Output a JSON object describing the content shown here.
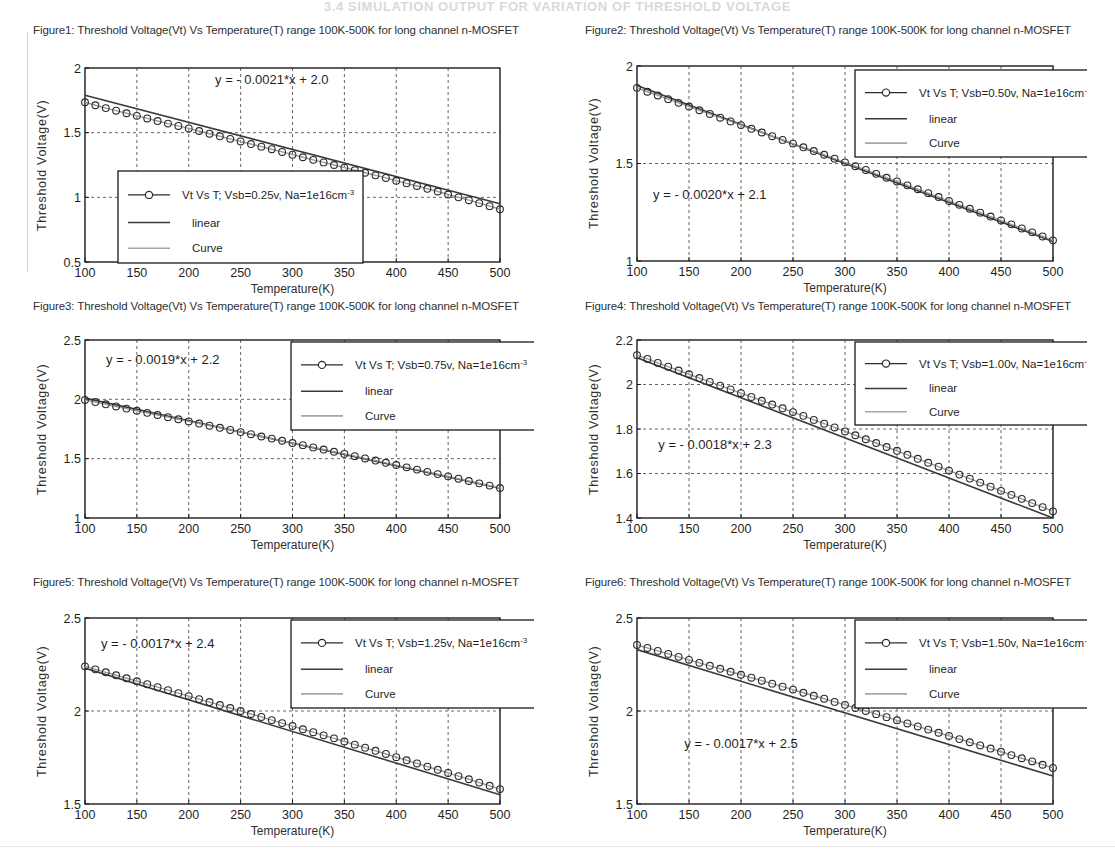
{
  "page": {
    "header_text": "3.4 SIMULATION OUTPUT FOR VARIATION OF THRESHOLD VOLTAGE"
  },
  "common": {
    "xlabel": "Temperature(K)",
    "ylabel": "Threshold Voltage(V)",
    "xticks": [
      100,
      150,
      200,
      250,
      300,
      350,
      400,
      450,
      500
    ],
    "legend_linear": "linear",
    "legend_curve": "Curve",
    "marker_label_prefix": "Vt Vs T; Vsb=",
    "marker_label_suffix": ", Na=1e16cm",
    "marker_label_exp": "-3"
  },
  "chart_data": [
    {
      "id": "figure1",
      "type": "line",
      "title": "Figure1: Threshold Voltage(Vt) Vs Temperature(T) range 100K-500K for long channel n-MOSFET",
      "xlabel": "Temperature(K)",
      "ylabel": "Threshold Voltage(V)",
      "xlim": [
        100,
        500
      ],
      "ylim": [
        0.5,
        2
      ],
      "xticks": [
        100,
        150,
        200,
        250,
        300,
        350,
        400,
        450,
        500
      ],
      "yticks": [
        0.5,
        1,
        1.5,
        2
      ],
      "ytick_labels": [
        "0.5",
        "1",
        "1.5",
        "2"
      ],
      "grid": true,
      "annotation": "y = - 0.0021*x + 2.0",
      "annotation_xy": [
        280,
        1.88
      ],
      "slope": -0.0021,
      "intercept": 2.0,
      "vsb": "0.25v",
      "na": "1e16cm-3",
      "legend_position": "lower-left",
      "legend": [
        "Vt Vs T; Vsb=0.25v, Na=1e16cm-3",
        "linear",
        "Curve"
      ],
      "x": [
        100,
        110,
        120,
        130,
        140,
        150,
        160,
        170,
        180,
        190,
        200,
        210,
        220,
        230,
        240,
        250,
        260,
        270,
        280,
        290,
        300,
        310,
        320,
        330,
        340,
        350,
        360,
        370,
        380,
        390,
        400,
        410,
        420,
        430,
        440,
        450,
        460,
        470,
        480,
        490,
        500
      ],
      "y": [
        1.735,
        1.712,
        1.69,
        1.67,
        1.65,
        1.63,
        1.61,
        1.59,
        1.57,
        1.552,
        1.533,
        1.513,
        1.492,
        1.472,
        1.452,
        1.432,
        1.412,
        1.392,
        1.372,
        1.351,
        1.33,
        1.31,
        1.29,
        1.27,
        1.25,
        1.23,
        1.21,
        1.19,
        1.17,
        1.15,
        1.128,
        1.108,
        1.088,
        1.066,
        1.045,
        1.022,
        1.0,
        0.978,
        0.955,
        0.932,
        0.908
      ]
    },
    {
      "id": "figure2",
      "type": "line",
      "title": "Figure2: Threshold Voltage(Vt) Vs Temperature(T) range 100K-500K for long channel n-MOSFET",
      "xlabel": "Temperature(K)",
      "ylabel": "Threshold Voltage(V)",
      "xlim": [
        100,
        500
      ],
      "ylim": [
        1,
        2
      ],
      "xticks": [
        100,
        150,
        200,
        250,
        300,
        350,
        400,
        450,
        500
      ],
      "yticks": [
        1,
        1.5,
        2
      ],
      "ytick_labels": [
        "1",
        "1.5",
        "2"
      ],
      "grid": true,
      "annotation": "y = - 0.0020*x + 2.1",
      "annotation_xy": [
        170,
        1.32
      ],
      "slope": -0.002,
      "intercept": 2.1,
      "vsb": "0.50v",
      "na": "1e16cm-3",
      "legend_position": "upper-right",
      "legend": [
        "Vt Vs T; Vsb=0.50v, Na=1e16cm-3",
        "linear",
        "Curve"
      ],
      "x": [
        100,
        110,
        120,
        130,
        140,
        150,
        160,
        170,
        180,
        190,
        200,
        210,
        220,
        230,
        240,
        250,
        260,
        270,
        280,
        290,
        300,
        310,
        320,
        330,
        340,
        350,
        360,
        370,
        380,
        390,
        400,
        410,
        420,
        430,
        440,
        450,
        460,
        470,
        480,
        490,
        500
      ],
      "y": [
        1.888,
        1.868,
        1.849,
        1.83,
        1.811,
        1.792,
        1.773,
        1.754,
        1.735,
        1.716,
        1.697,
        1.678,
        1.659,
        1.64,
        1.621,
        1.602,
        1.583,
        1.564,
        1.545,
        1.525,
        1.506,
        1.486,
        1.467,
        1.447,
        1.427,
        1.408,
        1.388,
        1.368,
        1.348,
        1.328,
        1.308,
        1.288,
        1.268,
        1.248,
        1.228,
        1.208,
        1.188,
        1.167,
        1.147,
        1.126,
        1.106
      ]
    },
    {
      "id": "figure3",
      "type": "line",
      "title": "Figure3: Threshold Voltage(Vt) Vs Temperature(T) range 100K-500K for long channel n-MOSFET",
      "xlabel": "Temperature(K)",
      "ylabel": "Threshold Voltage(V)",
      "xlim": [
        100,
        500
      ],
      "ylim": [
        1,
        2.5
      ],
      "xticks": [
        100,
        150,
        200,
        250,
        300,
        350,
        400,
        450,
        500
      ],
      "yticks": [
        1,
        1.5,
        2,
        2.5
      ],
      "ytick_labels": [
        "1",
        "1.5",
        "2",
        "2.5"
      ],
      "grid": true,
      "annotation": "y = - 0.0019*x + 2.2",
      "annotation_xy": [
        175,
        2.3
      ],
      "slope": -0.0019,
      "intercept": 2.2,
      "vsb": "0.75v",
      "na": "1e16cm-3",
      "legend_position": "upper-right",
      "legend": [
        "Vt Vs T; Vsb=0.75v, Na=1e16cm-3",
        "linear",
        "Curve"
      ],
      "x": [
        100,
        110,
        120,
        130,
        140,
        150,
        160,
        170,
        180,
        190,
        200,
        210,
        220,
        230,
        240,
        250,
        260,
        270,
        280,
        290,
        300,
        310,
        320,
        330,
        340,
        350,
        360,
        370,
        380,
        390,
        400,
        410,
        420,
        430,
        440,
        450,
        460,
        470,
        480,
        490,
        500
      ],
      "y": [
        1.995,
        1.977,
        1.958,
        1.94,
        1.922,
        1.904,
        1.886,
        1.868,
        1.85,
        1.832,
        1.814,
        1.796,
        1.778,
        1.76,
        1.742,
        1.724,
        1.706,
        1.687,
        1.669,
        1.651,
        1.632,
        1.614,
        1.595,
        1.577,
        1.558,
        1.54,
        1.521,
        1.502,
        1.484,
        1.465,
        1.446,
        1.427,
        1.408,
        1.389,
        1.37,
        1.351,
        1.331,
        1.312,
        1.292,
        1.273,
        1.253
      ]
    },
    {
      "id": "figure4",
      "type": "line",
      "title": "Figure4: Threshold Voltage(Vt) Vs Temperature(T) range 100K-500K for long channel n-MOSFET",
      "xlabel": "Temperature(K)",
      "ylabel": "Threshold Voltage(V)",
      "xlim": [
        100,
        500
      ],
      "ylim": [
        1.4,
        2.2
      ],
      "xticks": [
        100,
        150,
        200,
        250,
        300,
        350,
        400,
        450,
        500
      ],
      "yticks": [
        1.4,
        1.6,
        1.8,
        2,
        2.2
      ],
      "ytick_labels": [
        "1.4",
        "1.6",
        "1.8",
        "2",
        "2.2"
      ],
      "grid": true,
      "annotation": "y = - 0.0018*x + 2.3",
      "annotation_xy": [
        175,
        1.71
      ],
      "slope": -0.0018,
      "intercept": 2.3,
      "vsb": "1.00v",
      "na": "1e16cm-3",
      "legend_position": "upper-right",
      "legend": [
        "Vt Vs T; Vsb=1.00v, Na=1e16cm-3",
        "linear",
        "Curve"
      ],
      "x": [
        100,
        110,
        120,
        130,
        140,
        150,
        160,
        170,
        180,
        190,
        200,
        210,
        220,
        230,
        240,
        250,
        260,
        270,
        280,
        290,
        300,
        310,
        320,
        330,
        340,
        350,
        360,
        370,
        380,
        390,
        400,
        410,
        420,
        430,
        440,
        450,
        460,
        470,
        480,
        490,
        500
      ],
      "y": [
        2.132,
        2.115,
        2.097,
        2.08,
        2.063,
        2.046,
        2.029,
        2.012,
        1.995,
        1.978,
        1.961,
        1.944,
        1.927,
        1.91,
        1.893,
        1.876,
        1.859,
        1.841,
        1.824,
        1.807,
        1.789,
        1.772,
        1.754,
        1.737,
        1.719,
        1.702,
        1.684,
        1.666,
        1.648,
        1.631,
        1.613,
        1.595,
        1.577,
        1.559,
        1.541,
        1.522,
        1.504,
        1.486,
        1.467,
        1.449,
        1.43
      ]
    },
    {
      "id": "figure5",
      "type": "line",
      "title": "Figure5: Threshold Voltage(Vt) Vs Temperature(T) range 100K-500K for long channel n-MOSFET",
      "xlabel": "Temperature(K)",
      "ylabel": "Threshold Voltage(V)",
      "xlim": [
        100,
        500
      ],
      "ylim": [
        1.5,
        2.5
      ],
      "xticks": [
        100,
        150,
        200,
        250,
        300,
        350,
        400,
        450,
        500
      ],
      "yticks": [
        1.5,
        2,
        2.5
      ],
      "ytick_labels": [
        "1.5",
        "2",
        "2.5"
      ],
      "grid": true,
      "annotation": "y = - 0.0017*x + 2.4",
      "annotation_xy": [
        170,
        2.34
      ],
      "slope": -0.0017,
      "intercept": 2.4,
      "vsb": "1.25v",
      "na": "1e16cm-3",
      "legend_position": "upper-right",
      "legend": [
        "Vt Vs T; Vsb=1.25v, Na=1e16cm-3",
        "linear",
        "Curve"
      ],
      "x": [
        100,
        110,
        120,
        130,
        140,
        150,
        160,
        170,
        180,
        190,
        200,
        210,
        220,
        230,
        240,
        250,
        260,
        270,
        280,
        290,
        300,
        310,
        320,
        330,
        340,
        350,
        360,
        370,
        380,
        390,
        400,
        410,
        420,
        430,
        440,
        450,
        460,
        470,
        480,
        490,
        500
      ],
      "y": [
        2.24,
        2.224,
        2.208,
        2.192,
        2.176,
        2.16,
        2.144,
        2.128,
        2.112,
        2.096,
        2.08,
        2.064,
        2.048,
        2.032,
        2.016,
        2.0,
        1.984,
        1.968,
        1.951,
        1.935,
        1.919,
        1.902,
        1.886,
        1.869,
        1.853,
        1.836,
        1.819,
        1.803,
        1.786,
        1.769,
        1.752,
        1.735,
        1.718,
        1.701,
        1.684,
        1.667,
        1.65,
        1.633,
        1.615,
        1.598,
        1.58
      ]
    },
    {
      "id": "figure6",
      "type": "line",
      "title": "Figure6: Threshold Voltage(Vt) Vs Temperature(T) range 100K-500K for long channel n-MOSFET",
      "xlabel": "Temperature(K)",
      "ylabel": "Threshold Voltage(V)",
      "xlim": [
        100,
        500
      ],
      "ylim": [
        1.5,
        2.5
      ],
      "xticks": [
        100,
        150,
        200,
        250,
        300,
        350,
        400,
        450,
        500
      ],
      "yticks": [
        1.5,
        2,
        2.5
      ],
      "ytick_labels": [
        "1.5",
        "2",
        "2.5"
      ],
      "grid": true,
      "annotation": "y = - 0.0017*x + 2.5",
      "annotation_xy": [
        200,
        1.8
      ],
      "slope": -0.0017,
      "intercept": 2.5,
      "vsb": "1.50v",
      "na": "1e16cm-3",
      "legend_position": "upper-right",
      "legend": [
        "Vt Vs T; Vsb=1.50v, Na=1e16cm-3",
        "linear",
        "Curve"
      ],
      "x": [
        100,
        110,
        120,
        130,
        140,
        150,
        160,
        170,
        180,
        190,
        200,
        210,
        220,
        230,
        240,
        250,
        260,
        270,
        280,
        290,
        300,
        310,
        320,
        330,
        340,
        350,
        360,
        370,
        380,
        390,
        400,
        410,
        420,
        430,
        440,
        450,
        460,
        470,
        480,
        490,
        500
      ],
      "y": [
        2.355,
        2.339,
        2.323,
        2.307,
        2.291,
        2.275,
        2.259,
        2.243,
        2.227,
        2.211,
        2.195,
        2.179,
        2.163,
        2.147,
        2.131,
        2.115,
        2.098,
        2.082,
        2.066,
        2.049,
        2.033,
        2.016,
        2.0,
        1.983,
        1.967,
        1.95,
        1.933,
        1.917,
        1.9,
        1.883,
        1.866,
        1.849,
        1.832,
        1.815,
        1.798,
        1.781,
        1.763,
        1.746,
        1.729,
        1.711,
        1.694
      ]
    }
  ],
  "layout": {
    "figures": [
      {
        "left": 33,
        "top": 24,
        "plot_left": 52,
        "plot_top": 31,
        "plot_w": 415,
        "plot_h": 194,
        "legend": {
          "x": 33,
          "y": 103,
          "w": 245,
          "h": 92
        }
      },
      {
        "left": 585,
        "top": 24,
        "plot_left": 52,
        "plot_top": 29,
        "plot_w": 416,
        "plot_h": 195,
        "legend": {
          "x": 218,
          "y": 4,
          "w": 248,
          "h": 87
        }
      },
      {
        "left": 33,
        "top": 300,
        "plot_left": 52,
        "plot_top": 27,
        "plot_w": 415,
        "plot_h": 178,
        "legend": {
          "x": 206,
          "y": 2,
          "w": 245,
          "h": 88
        }
      },
      {
        "left": 585,
        "top": 300,
        "plot_left": 52,
        "plot_top": 27,
        "plot_w": 416,
        "plot_h": 178,
        "legend": {
          "x": 218,
          "y": 2,
          "w": 248,
          "h": 83
        }
      },
      {
        "left": 33,
        "top": 576,
        "plot_left": 52,
        "plot_top": 29,
        "plot_w": 415,
        "plot_h": 186,
        "legend": {
          "x": 206,
          "y": 2,
          "w": 245,
          "h": 88
        }
      },
      {
        "left": 585,
        "top": 576,
        "plot_left": 52,
        "plot_top": 29,
        "plot_w": 416,
        "plot_h": 186,
        "legend": {
          "x": 218,
          "y": 2,
          "w": 248,
          "h": 88
        }
      }
    ]
  }
}
